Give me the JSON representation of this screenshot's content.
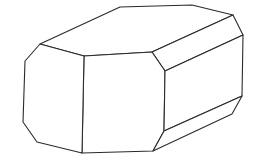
{
  "figure": {
    "stroke_color": "#2a2a2a",
    "background": "#ffffff",
    "faces": {
      "top": "40,44 120,7 192,5 233,15 152,52 84,56",
      "top_right_bevel": "152,52 233,15 243,35 165,71",
      "front": "84,56 152,52 165,71 164,131 153,151 82,153",
      "left": "40,44 84,56 82,153 37,142 23,122 25,61",
      "right": "165,71 243,35 242,96 164,131",
      "bottom_right_bevel": "164,131 242,96 232,114 153,151"
    }
  }
}
